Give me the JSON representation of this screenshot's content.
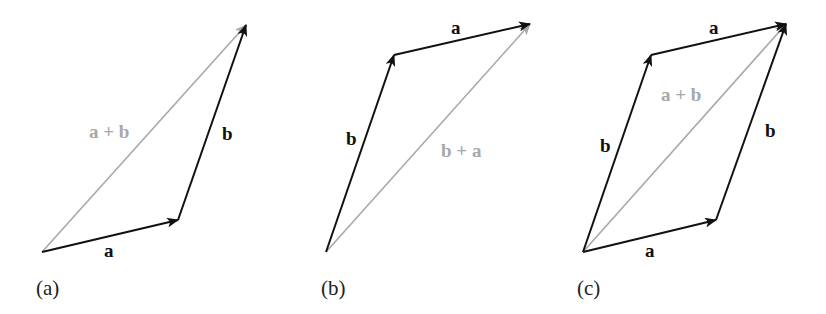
{
  "colors": {
    "vector": "#111111",
    "sum_vector": "#a8a8a8",
    "panel_label": "#222222",
    "background": "#ffffff"
  },
  "panels": [
    {
      "id": "a",
      "caption": "(a)",
      "vectors": [
        {
          "name": "a",
          "label": "a",
          "from": [
            42,
            252
          ],
          "to": [
            178,
            220
          ],
          "style": "black"
        },
        {
          "name": "b",
          "label": "b",
          "from": [
            178,
            220
          ],
          "to": [
            246,
            25
          ],
          "style": "black"
        },
        {
          "name": "sum",
          "label": "a + b",
          "from": [
            42,
            252
          ],
          "to": [
            246,
            25
          ],
          "style": "gray"
        }
      ]
    },
    {
      "id": "b",
      "caption": "(b)",
      "vectors": [
        {
          "name": "b",
          "label": "b",
          "from": [
            326,
            252
          ],
          "to": [
            394,
            55
          ],
          "style": "black"
        },
        {
          "name": "a",
          "label": "a",
          "from": [
            394,
            55
          ],
          "to": [
            530,
            24
          ],
          "style": "black"
        },
        {
          "name": "sum",
          "label": "b + a",
          "from": [
            326,
            252
          ],
          "to": [
            530,
            24
          ],
          "style": "gray"
        }
      ]
    },
    {
      "id": "c",
      "caption": "(c)",
      "vectors": [
        {
          "name": "a-bottom",
          "label": "a",
          "from": [
            583,
            252
          ],
          "to": [
            716,
            220
          ],
          "style": "black"
        },
        {
          "name": "b-right",
          "label": "b",
          "from": [
            716,
            220
          ],
          "to": [
            786,
            24
          ],
          "style": "black"
        },
        {
          "name": "b-left",
          "label": "b",
          "from": [
            583,
            252
          ],
          "to": [
            651,
            55
          ],
          "style": "black"
        },
        {
          "name": "a-top",
          "label": "a",
          "from": [
            651,
            55
          ],
          "to": [
            786,
            24
          ],
          "style": "black"
        },
        {
          "name": "sum",
          "label": "a + b",
          "from": [
            583,
            252
          ],
          "to": [
            786,
            24
          ],
          "style": "gray"
        }
      ]
    }
  ]
}
